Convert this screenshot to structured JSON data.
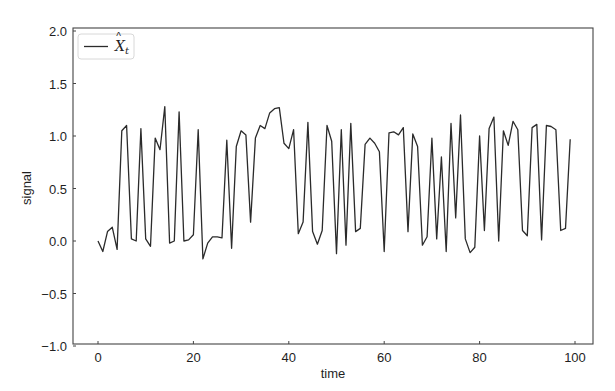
{
  "chart_data": {
    "type": "line",
    "title": "",
    "xlabel": "time",
    "ylabel": "signal",
    "xlim": [
      -4.9,
      104
    ],
    "ylim": [
      -1.0,
      2.0
    ],
    "xticks": [
      0,
      20,
      40,
      60,
      80,
      100
    ],
    "xtick_labels": [
      "0",
      "20",
      "40",
      "60",
      "80",
      "100"
    ],
    "yticks": [
      -1.0,
      -0.5,
      0.0,
      0.5,
      1.0,
      1.5,
      2.0
    ],
    "ytick_labels": [
      "−1.0",
      "−0.5",
      "0.0",
      "0.5",
      "1.0",
      "1.5",
      "2.0"
    ],
    "grid": false,
    "legend_position": "upper left",
    "series": [
      {
        "name": "X̂_t",
        "legend_label_base": "X",
        "legend_label_sub": "t",
        "color": "#2b2b2b",
        "x": [
          0,
          1,
          2,
          3,
          4,
          5,
          6,
          7,
          8,
          9,
          10,
          11,
          12,
          13,
          14,
          15,
          16,
          17,
          18,
          19,
          20,
          21,
          22,
          23,
          24,
          25,
          26,
          27,
          28,
          29,
          30,
          31,
          32,
          33,
          34,
          35,
          36,
          37,
          38,
          39,
          40,
          41,
          42,
          43,
          44,
          45,
          46,
          47,
          48,
          49,
          50,
          51,
          52,
          53,
          54,
          55,
          56,
          57,
          58,
          59,
          60,
          61,
          62,
          63,
          64,
          65,
          66,
          67,
          68,
          69,
          70,
          71,
          72,
          73,
          74,
          75,
          76,
          77,
          78,
          79,
          80,
          81,
          82,
          83,
          84,
          85,
          86,
          87,
          88,
          89,
          90,
          91,
          92,
          93,
          94,
          95,
          96,
          97,
          98,
          99
        ],
        "values": [
          0.0,
          -0.1,
          0.09,
          0.13,
          -0.08,
          1.05,
          1.1,
          0.02,
          0.0,
          1.07,
          0.02,
          -0.05,
          0.98,
          0.87,
          1.28,
          -0.02,
          0.0,
          1.23,
          0.0,
          0.01,
          0.06,
          1.06,
          -0.17,
          -0.02,
          0.04,
          0.04,
          0.03,
          0.96,
          -0.07,
          0.9,
          1.05,
          1.01,
          0.18,
          0.98,
          1.1,
          1.07,
          1.22,
          1.26,
          1.27,
          0.93,
          0.88,
          1.06,
          0.07,
          0.18,
          1.13,
          0.09,
          -0.03,
          0.1,
          1.1,
          0.95,
          -0.12,
          1.06,
          -0.04,
          1.12,
          0.09,
          0.12,
          0.92,
          0.98,
          0.93,
          0.85,
          -0.1,
          1.03,
          1.04,
          1.01,
          1.08,
          0.09,
          1.02,
          0.9,
          -0.04,
          0.04,
          0.98,
          0.02,
          0.8,
          -0.1,
          1.12,
          0.22,
          1.2,
          0.02,
          -0.11,
          -0.06,
          1.0,
          0.1,
          1.07,
          1.18,
          0.0,
          1.05,
          0.91,
          1.14,
          1.06,
          0.1,
          0.05,
          1.08,
          1.11,
          0.01,
          1.1,
          1.09,
          1.06,
          0.1,
          0.12,
          0.97
        ]
      }
    ]
  }
}
